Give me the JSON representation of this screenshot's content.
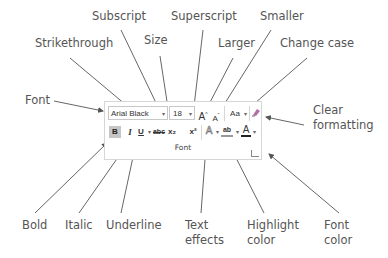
{
  "diagram": {
    "labels_top": [
      {
        "id": "subscript",
        "text": "Subscript"
      },
      {
        "id": "superscript",
        "text": "Superscript"
      },
      {
        "id": "smaller",
        "text": "Smaller"
      },
      {
        "id": "strikethrough",
        "text": "Strikethrough"
      },
      {
        "id": "size",
        "text": "Size"
      },
      {
        "id": "larger",
        "text": "Larger"
      },
      {
        "id": "change_case",
        "text": "Change case"
      }
    ],
    "labels_side": [
      {
        "id": "font",
        "text": "Font"
      },
      {
        "id": "clear_formatting_1",
        "text": "Clear"
      },
      {
        "id": "clear_formatting_2",
        "text": "formatting"
      }
    ],
    "labels_bottom": [
      {
        "id": "bold",
        "text": "Bold"
      },
      {
        "id": "italic",
        "text": "Italic"
      },
      {
        "id": "underline",
        "text": "Underline"
      },
      {
        "id": "text_effects_1",
        "text": "Text"
      },
      {
        "id": "text_effects_2",
        "text": "effects"
      },
      {
        "id": "highlight_1",
        "text": "Highlight"
      },
      {
        "id": "highlight_2",
        "text": "color"
      },
      {
        "id": "font_color_1",
        "text": "Font"
      },
      {
        "id": "font_color_2",
        "text": "color"
      }
    ]
  },
  "ribbon": {
    "font_name": "Arial Black",
    "font_size": "18",
    "dropdown_glyph": "▾",
    "grow_font": "A",
    "shrink_font": "A",
    "change_case": "Aa",
    "clear_formatting_icon": "clear-formatting",
    "bold": "B",
    "italic": "I",
    "underline": "U",
    "strikethrough": "abc",
    "subscript": "x₂",
    "superscript": "x²",
    "text_effects": "A",
    "highlight": "ab",
    "font_color": "A",
    "group_label": "Font",
    "font_color_swatch": "#222222"
  }
}
